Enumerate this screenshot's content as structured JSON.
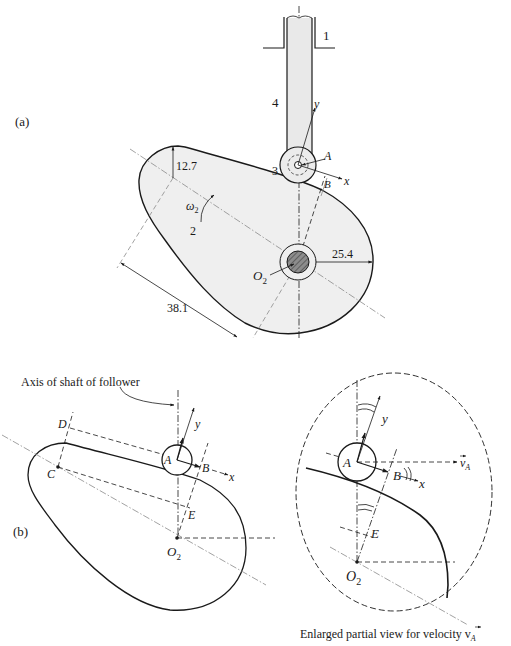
{
  "figure": {
    "panel_a_label": "(a)",
    "panel_b_label": "(b)",
    "colors": {
      "ink": "#1a1a1a",
      "cam_fill": "#efefef",
      "shaft_hatch": "#7a7a7a",
      "centerline": "#8a8a8a"
    }
  },
  "panel_a": {
    "link_labels": {
      "frame": "1",
      "cam": "2",
      "roller": "3",
      "follower": "4"
    },
    "points": {
      "A": "A",
      "B": "B",
      "O2": "O",
      "O2_sub": "2"
    },
    "axes": {
      "x": "x",
      "y": "y"
    },
    "omega": "ω",
    "omega_sub": "2",
    "dimensions": {
      "small_radius": "12.7",
      "large_radius": "25.4",
      "center_distance": "38.1"
    }
  },
  "panel_b": {
    "annotation": "Axis of shaft of follower",
    "points": {
      "A": "A",
      "B": "B",
      "C": "C",
      "D": "D",
      "E": "E",
      "O2": "O",
      "O2_sub": "2"
    },
    "axes": {
      "x": "x",
      "y": "y"
    }
  },
  "enlarged_view": {
    "points": {
      "A": "A",
      "B": "B",
      "E": "E",
      "O2": "O",
      "O2_sub": "2"
    },
    "axes": {
      "x": "x",
      "y": "y"
    },
    "velocity_label": "v",
    "velocity_sub": "A",
    "caption": "Enlarged partial view for velocity v",
    "caption_sub": "A"
  }
}
